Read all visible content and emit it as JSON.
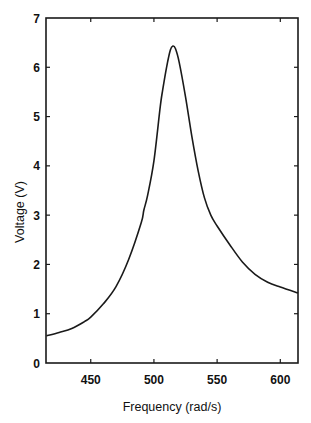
{
  "chart_data": {
    "type": "line",
    "title": "",
    "xlabel": "Frequency (rad/s)",
    "ylabel": "Voltage (V)",
    "xlim": [
      414.6,
      614
    ],
    "ylim": [
      0,
      7
    ],
    "xticks": [
      450,
      500,
      550,
      600
    ],
    "xtick_labels": [
      "450",
      "500",
      "550",
      "600"
    ],
    "yticks": [
      0,
      1,
      2,
      3,
      4,
      5,
      6,
      7
    ],
    "ytick_labels": [
      "0",
      "1",
      "2",
      "3",
      "4",
      "5",
      "6",
      "7"
    ],
    "grid": false,
    "legend": null,
    "series": [
      {
        "name": "Voltage",
        "color": "#1a1a1a",
        "x": [
          415,
          425,
          435,
          445,
          450,
          460,
          470,
          480,
          490,
          492,
          495,
          500,
          505,
          507,
          510,
          513,
          515,
          517,
          520,
          525,
          530,
          535,
          540,
          545,
          550,
          560,
          570,
          580,
          590,
          600,
          614
        ],
        "y": [
          0.55,
          0.62,
          0.7,
          0.84,
          0.93,
          1.2,
          1.55,
          2.1,
          2.85,
          3.1,
          3.4,
          4.1,
          5.2,
          5.55,
          6.0,
          6.35,
          6.43,
          6.38,
          6.1,
          5.4,
          4.6,
          3.9,
          3.35,
          3.0,
          2.78,
          2.4,
          2.05,
          1.8,
          1.64,
          1.54,
          1.42
        ]
      }
    ]
  },
  "labels": {
    "xlabel": "Frequency (rad/s)",
    "ylabel": "Voltage (V)"
  }
}
